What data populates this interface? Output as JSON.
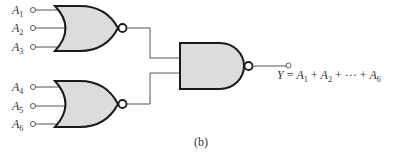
{
  "diagram": {
    "colors": {
      "stroke": "#1a1a1a",
      "wire": "#555555",
      "gate_fill": "#dcdcdc",
      "text": "#333333"
    },
    "inputs": [
      {
        "label": "A",
        "sub": "1"
      },
      {
        "label": "A",
        "sub": "2"
      },
      {
        "label": "A",
        "sub": "3"
      },
      {
        "label": "A",
        "sub": "4"
      },
      {
        "label": "A",
        "sub": "5"
      },
      {
        "label": "A",
        "sub": "6"
      }
    ],
    "gates": [
      {
        "type": "NOR",
        "inputs": [
          "A1",
          "A2",
          "A3"
        ]
      },
      {
        "type": "NOR",
        "inputs": [
          "A4",
          "A5",
          "A6"
        ]
      },
      {
        "type": "NAND",
        "inputs": [
          "NOR1",
          "NOR2"
        ]
      }
    ],
    "output": {
      "lhs": "Y",
      "eq": " = ",
      "terms": [
        {
          "label": "A",
          "sub": "1"
        },
        {
          "label": "A",
          "sub": "2"
        },
        {
          "label": "A",
          "sub": "6"
        }
      ],
      "plus": " + ",
      "ellipsis": "···"
    },
    "caption": "(b)"
  }
}
